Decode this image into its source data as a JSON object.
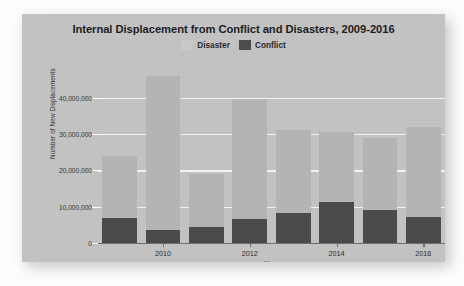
{
  "chart_data": {
    "type": "bar",
    "subtype": "stacked-bar",
    "title": "Internal Displacement from Conflict and Disasters, 2009-2016",
    "xlabel": "Year",
    "ylabel": "Number of New Displacements",
    "categories": [
      "2009",
      "2010",
      "2011",
      "2012",
      "2013",
      "2014",
      "2015",
      "2016"
    ],
    "x_tick_labels": [
      "2010",
      "2012",
      "2014",
      "2016"
    ],
    "y_tick_labels": [
      "0",
      "10,000,000",
      "20,000,000",
      "30,000,000",
      "40,000,000"
    ],
    "y_tick_values": [
      0,
      10000000,
      20000000,
      30000000,
      40000000
    ],
    "ylim": [
      0,
      46500000
    ],
    "grid": true,
    "legend_position": "top-center",
    "series": [
      {
        "name": "Conflict",
        "color": "#4a4a4a",
        "values": [
          6900000,
          3500000,
          4500000,
          6500000,
          8300000,
          11300000,
          9200000,
          7200000
        ]
      },
      {
        "name": "Disaster",
        "color": "#b4b4b4",
        "values": [
          17000000,
          42500000,
          14500000,
          33000000,
          22700000,
          19200000,
          19800000,
          24800000
        ]
      }
    ],
    "totals": [
      23900000,
      46000000,
      19000000,
      39500000,
      31000000,
      30500000,
      29000000,
      32000000
    ]
  },
  "legend": {
    "items": [
      {
        "label": "Disaster",
        "color": "#c9c9c9"
      },
      {
        "label": "Conflict",
        "color": "#4d4d4d"
      }
    ]
  },
  "colors": {
    "panel_background": "#c2c2c2",
    "page_background": "#fdfdfd",
    "gridline": "#f2f2f2",
    "axis": "#6e6e6e",
    "title_text": "#1d1d1d"
  }
}
